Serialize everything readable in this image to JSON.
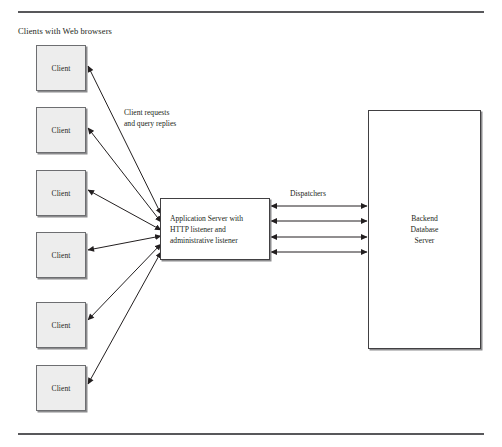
{
  "figure": {
    "caption_top": "Clients with Web browsers",
    "annotations": {
      "client_requests": "Client requests\nand query replies",
      "dispatchers": "Dispatchers"
    },
    "clients": [
      {
        "label": "Client"
      },
      {
        "label": "Client"
      },
      {
        "label": "Client"
      },
      {
        "label": "Client"
      },
      {
        "label": "Client"
      },
      {
        "label": "Client"
      }
    ],
    "app_server": {
      "label": "Application Server with\nHTTP listener and\nadministrative listener"
    },
    "backend": {
      "label": "Backend\nDatabase\nServer"
    },
    "colors": {
      "client_fill": "#ededed",
      "client_stroke": "#6d6e71",
      "box_stroke": "#414042",
      "shadow": "#8c8c8e",
      "rule": "#58585b",
      "line": "#231f20",
      "text": "#231f20",
      "background": "#ffffff"
    },
    "link_counts": {
      "client_links": 6,
      "dispatcher_links": 4
    }
  }
}
